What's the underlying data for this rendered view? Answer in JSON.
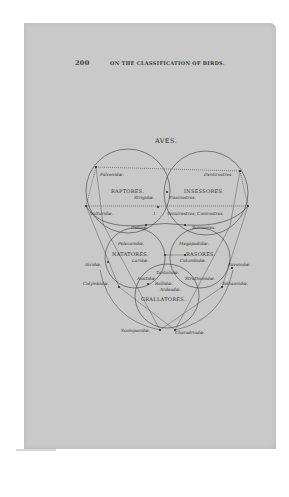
{
  "page": {
    "number": "200",
    "running_head": "ON THE CLASSIFICATION OF BIRDS.",
    "figure_title": "AVES."
  },
  "diagram": {
    "groups": {
      "raptores": "RAPTORES.",
      "insessores": "INSESSORES.",
      "natatores": "NATATORES.",
      "rasores": "RASORES.",
      "grallatores": "GRALLATORES."
    },
    "families": {
      "falconidae": "Falconidæ.",
      "dentirostres": "Dentirostres.",
      "strigidae": "Strigidæ.",
      "fissirostres": "Fissirostres.",
      "vulturidae": "Vulturidæ.",
      "tenuirostres_conirostres": "Tenuirostres, Conirostres.",
      "didinae": "Didinæ.",
      "scansores": "Scansores.",
      "pelecanidae": "Pelecanidæ.",
      "megapodidae": "Megapodidæ.",
      "laridae": "Laridæ.",
      "columbidae": "Columbidæ.",
      "alcidae": "Alcidæ.",
      "pavonidae": "Pavonidæ.",
      "tantalidae": "Tantalidæ.",
      "anatidae": "Anatidæ.",
      "struthionidae": "Struthionidæ.",
      "colymbidae": "Colymbidæ.",
      "tetraonidae": "Tetraonidæ.",
      "rallidae": "Rallidæ.",
      "ardeada": "Ardeadæ.",
      "scolopacidae": "Scolopacidæ.",
      "charadriadae": "Charadriadæ."
    },
    "marker_one": "1"
  },
  "colors": {
    "paper": "#c9c9c9",
    "ink": "#333333",
    "background": "#ffffff"
  }
}
